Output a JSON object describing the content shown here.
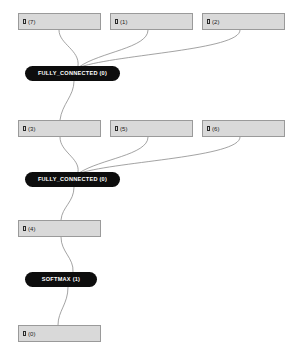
{
  "graph": {
    "type": "neural-network-op-graph",
    "background_color": "#ffffff",
    "tensor_fill_color": "#d9d9d9",
    "tensor_border_color": "#9a9a9a",
    "op_fill_color": "#0d0d0d",
    "op_text_color": "#ffffff",
    "edge_color": "#8c8c8c",
    "tensors": [
      {
        "id": "t7",
        "label": "(7)",
        "glyph": "tensor-icon",
        "x": 18,
        "y": 13,
        "w": 83
      },
      {
        "id": "t1",
        "label": "(1)",
        "glyph": "tensor-icon",
        "x": 110,
        "y": 13,
        "w": 83
      },
      {
        "id": "t2",
        "label": "(2)",
        "glyph": "tensor-icon",
        "x": 202,
        "y": 13,
        "w": 83
      },
      {
        "id": "t3",
        "label": "(3)",
        "glyph": "tensor-icon",
        "x": 18,
        "y": 120,
        "w": 83
      },
      {
        "id": "t5",
        "label": "(5)",
        "glyph": "tensor-icon",
        "x": 110,
        "y": 120,
        "w": 83
      },
      {
        "id": "t6",
        "label": "(6)",
        "glyph": "tensor-icon",
        "x": 202,
        "y": 120,
        "w": 83
      },
      {
        "id": "t4",
        "label": "(4)",
        "glyph": "tensor-icon",
        "x": 18,
        "y": 220,
        "w": 83
      },
      {
        "id": "t0",
        "label": "(0)",
        "glyph": "tensor-icon",
        "x": 18,
        "y": 325,
        "w": 83
      }
    ],
    "operations": [
      {
        "id": "fc0a",
        "label": "FULLY_CONNECTED (0)",
        "x": 25,
        "y": 66,
        "w": 95
      },
      {
        "id": "fc0b",
        "label": "FULLY_CONNECTED (0)",
        "x": 25,
        "y": 172,
        "w": 95
      },
      {
        "id": "sm1",
        "label": "SOFTMAX (1)",
        "x": 25,
        "y": 272,
        "w": 72
      }
    ],
    "edges": [
      {
        "from": "t7",
        "to": "fc0a",
        "path": "M59,30 C59,44 80,50 78,66"
      },
      {
        "from": "t1",
        "to": "fc0a",
        "path": "M148,30 C148,48 100,52 79,67"
      },
      {
        "from": "t2",
        "to": "fc0a",
        "path": "M240,30 C240,50 120,54 80,67"
      },
      {
        "from": "fc0a",
        "to": "t3",
        "path": "M74,81 C74,96 62,104 60,120"
      },
      {
        "from": "t3",
        "to": "fc0b",
        "path": "M60,137 C60,152 80,158 78,172"
      },
      {
        "from": "t5",
        "to": "fc0b",
        "path": "M148,137 C148,155 100,159 79,173"
      },
      {
        "from": "t6",
        "to": "fc0b",
        "path": "M240,137 C240,157 120,161 80,173"
      },
      {
        "from": "fc0b",
        "to": "t4",
        "path": "M74,187 C74,202 62,207 61,220"
      },
      {
        "from": "t4",
        "to": "sm1",
        "path": "M61,237 C61,252 74,258 73,272"
      },
      {
        "from": "sm1",
        "to": "t0",
        "path": "M68,287 C68,304 58,311 58,325"
      }
    ]
  }
}
